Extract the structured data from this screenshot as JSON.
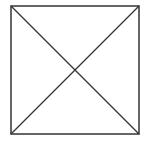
{
  "diagram": {
    "type": "square-with-diagonals",
    "stroke_color": "#333333",
    "background": "#ffffff",
    "square": {
      "x": 11,
      "y": 6,
      "width": 128,
      "height": 128
    },
    "diagonals": [
      {
        "x1": 11,
        "y1": 6,
        "x2": 139,
        "y2": 134
      },
      {
        "x1": 139,
        "y1": 6,
        "x2": 11,
        "y2": 134
      }
    ]
  }
}
